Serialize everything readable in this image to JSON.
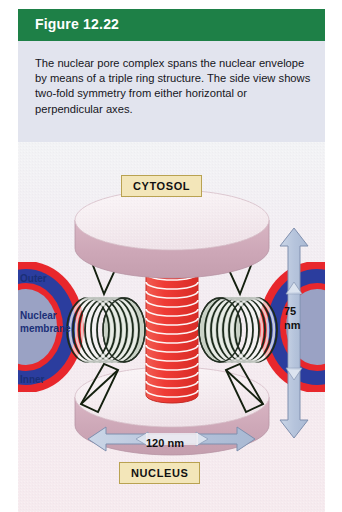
{
  "figure": {
    "header_label": "Figure 12.22",
    "caption": "The nuclear pore complex spans the nuclear envelope by means of a triple ring structure. The side view shows two-fold symmetry from either horizontal or perpendicular axes.",
    "header_color": "#1e8047",
    "caption_bg_color": "#e2e4ee",
    "panel_bg_color": "#f3eaf0"
  },
  "diagram": {
    "compartment_top_label": "CYTOSOL",
    "compartment_bottom_label": "NUCLEUS",
    "membrane_outer_label": "Outer",
    "membrane_name_line1": "Nuclear",
    "membrane_name_line2": "membrane",
    "membrane_inner_label": "Inner",
    "height_value": "75",
    "height_unit": "nm",
    "width_label": "120 nm",
    "colors": {
      "membrane_outline": "#e8272c",
      "membrane_fill": "#2b3d9e",
      "membrane_lumen": "#9aa2c4",
      "ring_disk_top_face": "#f7eef2",
      "ring_disk_side": "#cfa8b8",
      "central_pore": "#ef3b35",
      "spoke_ring": "#1c2a1c",
      "spoke_ring_cap": "#c9d2c6",
      "arrow_fill": "#b9c6dd",
      "arrow_stroke": "#7f8fae",
      "tag_fill": "#f3e6b9",
      "tag_border": "#b9a251",
      "label_text": "#1a2f77"
    }
  }
}
